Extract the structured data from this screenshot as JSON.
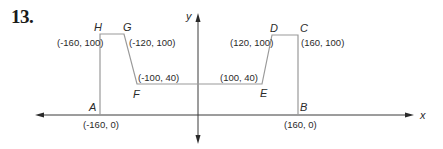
{
  "problem": {
    "number": "13."
  },
  "axes": {
    "x_label": "x",
    "y_label": "y"
  },
  "points": {
    "A": {
      "label": "A",
      "coord": "(-160, 0)"
    },
    "B": {
      "label": "B",
      "coord": "(160, 0)"
    },
    "C": {
      "label": "C",
      "coord": "(160, 100)"
    },
    "D": {
      "label": "D",
      "coord": "(120, 100)"
    },
    "E": {
      "label": "E",
      "coord": "(100, 40)"
    },
    "F": {
      "label": "F",
      "coord": "(-100, 40)"
    },
    "G": {
      "label": "G",
      "coord": "(-120, 100)"
    },
    "H": {
      "label": "H",
      "coord": "(-160, 100)"
    }
  },
  "colors": {
    "axis": "#3a3a3a",
    "shape": "#9a9a9a",
    "text": "#2a2a2a"
  }
}
